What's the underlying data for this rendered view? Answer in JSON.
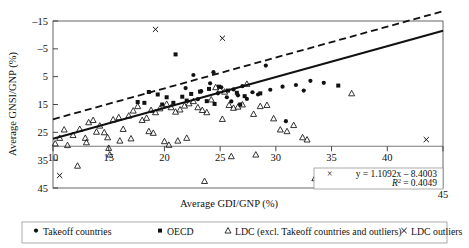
{
  "chart_data": {
    "type": "scatter",
    "title": "",
    "xlabel": "Average GDI/GNP (%)",
    "ylabel": "Average GNSI/GNP (%)",
    "xlim": [
      10,
      45
    ],
    "ylim": [
      -15,
      45
    ],
    "xticks": [
      10,
      15,
      20,
      25,
      30,
      35,
      40,
      45
    ],
    "yticks": [
      -15,
      -5,
      5,
      15,
      25,
      35,
      45
    ],
    "grid": false,
    "legend_position": "bottom",
    "annotations": {
      "equation": "y = 1.1092x – 8.4003",
      "r_squared_label": "R",
      "r_squared_exp": "2",
      "r_squared_value": "= 0.4049",
      "marker": "×"
    },
    "fit_line": {
      "name": "regression-line",
      "style": "solid",
      "slope": 1.1092,
      "intercept": -8.4003,
      "x_start": 10,
      "x_end": 45
    },
    "reference_line": {
      "name": "dashed-reference-line",
      "style": "dashed",
      "slope": 1.1092,
      "intercept": -1.4,
      "x_start": 10,
      "x_end": 45
    },
    "series": [
      {
        "name": "Takeoff countries",
        "marker": "circle",
        "color": "#111111",
        "points": [
          [
            22.6,
            25.6
          ],
          [
            24.1,
            22.6
          ],
          [
            25.1,
            21.2
          ],
          [
            23.3,
            19.8
          ],
          [
            24.8,
            19.0
          ],
          [
            26.2,
            20.4
          ],
          [
            27.0,
            21.6
          ],
          [
            27.9,
            19.4
          ],
          [
            25.6,
            17.6
          ],
          [
            26.6,
            18.3
          ],
          [
            28.4,
            18.6
          ],
          [
            29.5,
            20.3
          ],
          [
            30.6,
            21.4
          ],
          [
            31.8,
            22.0
          ],
          [
            33.1,
            23.5
          ],
          [
            34.3,
            22.8
          ],
          [
            29.1,
            29.0
          ],
          [
            24.4,
            26.6
          ],
          [
            21.9,
            20.9
          ],
          [
            23.0,
            16.9
          ],
          [
            26.0,
            16.1
          ],
          [
            27.4,
            17.0
          ],
          [
            30.9,
            9.0
          ],
          [
            32.5,
            20.0
          ]
        ]
      },
      {
        "name": "OECD",
        "marker": "square",
        "color": "#111111",
        "points": [
          [
            21.0,
            33.0
          ],
          [
            18.6,
            19.5
          ],
          [
            19.4,
            18.6
          ],
          [
            20.2,
            17.6
          ],
          [
            21.6,
            17.8
          ],
          [
            22.4,
            18.8
          ],
          [
            23.2,
            19.6
          ],
          [
            24.0,
            20.6
          ],
          [
            24.9,
            21.4
          ],
          [
            25.7,
            20.0
          ],
          [
            26.5,
            19.2
          ],
          [
            22.0,
            16.4
          ],
          [
            20.8,
            15.6
          ],
          [
            19.8,
            15.0
          ],
          [
            18.2,
            15.6
          ],
          [
            17.6,
            15.9
          ],
          [
            23.8,
            16.2
          ],
          [
            27.2,
            18.0
          ],
          [
            28.6,
            19.0
          ],
          [
            35.6,
            21.8
          ],
          [
            24.5,
            15.2
          ],
          [
            26.8,
            15.0
          ]
        ]
      },
      {
        "name": "LDC (excl. Takeoff countries and outliers)",
        "marker": "triangle",
        "color": "#111111",
        "points": [
          [
            10.2,
            1.0
          ],
          [
            10.6,
            3.0
          ],
          [
            11.3,
            0.4
          ],
          [
            11.8,
            4.0
          ],
          [
            12.4,
            6.2
          ],
          [
            12.9,
            3.0
          ],
          [
            13.2,
            8.6
          ],
          [
            13.6,
            9.4
          ],
          [
            13.9,
            5.2
          ],
          [
            14.2,
            7.4
          ],
          [
            14.6,
            5.0
          ],
          [
            14.9,
            3.2
          ],
          [
            15.0,
            -0.6
          ],
          [
            15.4,
            9.6
          ],
          [
            15.9,
            10.4
          ],
          [
            16.3,
            6.2
          ],
          [
            16.8,
            11.0
          ],
          [
            17.2,
            12.8
          ],
          [
            17.6,
            14.4
          ],
          [
            18.0,
            9.4
          ],
          [
            18.4,
            10.2
          ],
          [
            18.8,
            13.0
          ],
          [
            19.2,
            12.2
          ],
          [
            19.6,
            13.6
          ],
          [
            20.0,
            1.8
          ],
          [
            20.2,
            15.2
          ],
          [
            20.4,
            0.5
          ],
          [
            20.6,
            14.0
          ],
          [
            21.0,
            12.4
          ],
          [
            21.4,
            13.2
          ],
          [
            21.8,
            14.6
          ],
          [
            22.2,
            15.4
          ],
          [
            22.6,
            16.2
          ],
          [
            23.0,
            14.0
          ],
          [
            23.4,
            13.0
          ],
          [
            23.8,
            12.2
          ],
          [
            24.2,
            16.8
          ],
          [
            24.6,
            21.2
          ],
          [
            25.0,
            20.4
          ],
          [
            25.4,
            19.6
          ],
          [
            25.8,
            14.8
          ],
          [
            26.2,
            13.8
          ],
          [
            26.6,
            14.2
          ],
          [
            27.0,
            15.0
          ],
          [
            27.4,
            22.4
          ],
          [
            28.0,
            11.6
          ],
          [
            28.6,
            14.4
          ],
          [
            29.2,
            14.8
          ],
          [
            29.8,
            10.0
          ],
          [
            30.4,
            6.0
          ],
          [
            31.0,
            5.4
          ],
          [
            31.6,
            7.6
          ],
          [
            32.4,
            3.2
          ],
          [
            32.8,
            2.4
          ],
          [
            33.5,
            -11.5
          ],
          [
            23.6,
            -12.5
          ],
          [
            12.2,
            -7.0
          ],
          [
            15.1,
            -3.0
          ],
          [
            26.0,
            -3.6
          ],
          [
            28.2,
            -3.0
          ],
          [
            36.8,
            19.0
          ],
          [
            17.0,
            2.8
          ],
          [
            16.0,
            2.0
          ],
          [
            13.0,
            1.4
          ],
          [
            11.0,
            6.0
          ],
          [
            19.0,
            4.8
          ],
          [
            21.2,
            2.0
          ],
          [
            22.0,
            3.0
          ],
          [
            25.2,
            9.8
          ],
          [
            18.6,
            5.4
          ]
        ]
      },
      {
        "name": "LDC outliers",
        "marker": "cross",
        "color": "#111111",
        "points": [
          [
            19.2,
            42.0
          ],
          [
            25.2,
            38.8
          ],
          [
            43.5,
            2.4
          ],
          [
            10.6,
            -10.5
          ]
        ]
      }
    ]
  },
  "legend": {
    "items": [
      {
        "label": "Takeoff countries",
        "marker": "circle"
      },
      {
        "label": "OECD",
        "marker": "square"
      },
      {
        "label": "LDC (excl. Takeoff countries and outliers)",
        "marker": "triangle"
      },
      {
        "label": "LDC outliers",
        "marker": "cross"
      }
    ]
  },
  "axes": {
    "x_label": "Average GDI/GNP (%)",
    "y_label": "Average GNSI/GNP (%)",
    "x_tick_labels": [
      "10",
      "15",
      "20",
      "25",
      "30",
      "35",
      "40",
      "45"
    ],
    "y_tick_labels": [
      "45",
      "35",
      "25",
      "15",
      "5",
      "–5",
      "–15"
    ]
  }
}
